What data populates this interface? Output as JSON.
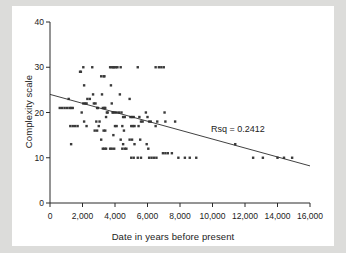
{
  "chart_data": {
    "type": "scatter",
    "title": "",
    "xlabel": "Date in years before present",
    "ylabel": "Complexity scale",
    "xlim": [
      0,
      16000
    ],
    "ylim": [
      0,
      40
    ],
    "grid": false,
    "legend": "none",
    "xticks": [
      0,
      2000,
      4000,
      6000,
      8000,
      10000,
      12000,
      14000,
      16000
    ],
    "xticklabels": [
      "0",
      "2,000",
      "4,000",
      "6,000",
      "8,000",
      "10,000",
      "12,000",
      "14,000",
      "16,000"
    ],
    "yticks": [
      0,
      10,
      20,
      30,
      40
    ],
    "yticklabels": [
      "0",
      "10",
      "20",
      "30",
      "40"
    ],
    "annotations": [
      {
        "text": "Rsq = 0.2412",
        "x": 12000,
        "y": 16.2
      }
    ],
    "trendline": {
      "type": "linear-fit",
      "x": [
        0,
        16000
      ],
      "y": [
        24.0,
        8.2
      ],
      "intercept": 24.0,
      "slope_per_1000yr": -0.9875,
      "r_squared": 0.2412
    },
    "marker": {
      "shape": "square",
      "color": "#3a3a3a",
      "size_px": 2.4
    },
    "series": [
      {
        "name": "Sites",
        "points": [
          [
            600,
            21
          ],
          [
            750,
            21
          ],
          [
            900,
            21
          ],
          [
            1050,
            21
          ],
          [
            1150,
            23
          ],
          [
            1200,
            21
          ],
          [
            1300,
            21
          ],
          [
            1400,
            21
          ],
          [
            1250,
            17
          ],
          [
            1400,
            17
          ],
          [
            1550,
            17
          ],
          [
            1700,
            17
          ],
          [
            1300,
            13
          ],
          [
            1850,
            29
          ],
          [
            1900,
            29
          ],
          [
            2050,
            30
          ],
          [
            1950,
            20
          ],
          [
            2050,
            22
          ],
          [
            2150,
            22
          ],
          [
            2250,
            22
          ],
          [
            2100,
            26
          ],
          [
            2300,
            23
          ],
          [
            2450,
            23
          ],
          [
            2250,
            17
          ],
          [
            2100,
            18
          ],
          [
            2600,
            30
          ],
          [
            2650,
            24
          ],
          [
            2700,
            22
          ],
          [
            2800,
            22
          ],
          [
            2900,
            21
          ],
          [
            2950,
            21
          ],
          [
            2850,
            18
          ],
          [
            2750,
            16
          ],
          [
            2900,
            16
          ],
          [
            3050,
            18
          ],
          [
            3000,
            17
          ],
          [
            3150,
            28
          ],
          [
            3300,
            28
          ],
          [
            3350,
            28
          ],
          [
            3200,
            24
          ],
          [
            3250,
            21
          ],
          [
            3350,
            21
          ],
          [
            3400,
            21
          ],
          [
            3500,
            20
          ],
          [
            3550,
            20
          ],
          [
            3450,
            19
          ],
          [
            3300,
            16
          ],
          [
            3400,
            16
          ],
          [
            3150,
            14
          ],
          [
            3250,
            12
          ],
          [
            3350,
            12
          ],
          [
            3450,
            12
          ],
          [
            3700,
            30
          ],
          [
            3800,
            30
          ],
          [
            3900,
            30
          ],
          [
            3950,
            30
          ],
          [
            4050,
            30
          ],
          [
            4150,
            30
          ],
          [
            3750,
            26
          ],
          [
            3800,
            22
          ],
          [
            3850,
            20
          ],
          [
            3900,
            20
          ],
          [
            4000,
            20
          ],
          [
            4100,
            20
          ],
          [
            4000,
            17
          ],
          [
            4100,
            17
          ],
          [
            3900,
            15
          ],
          [
            3700,
            12
          ],
          [
            3800,
            12
          ],
          [
            3950,
            12
          ],
          [
            4350,
            30
          ],
          [
            4300,
            24
          ],
          [
            4250,
            20
          ],
          [
            4400,
            20
          ],
          [
            4500,
            19
          ],
          [
            4600,
            19
          ],
          [
            4450,
            17
          ],
          [
            4550,
            16
          ],
          [
            4350,
            14
          ],
          [
            4500,
            13
          ],
          [
            4600,
            12
          ],
          [
            4700,
            12
          ],
          [
            4450,
            12
          ],
          [
            4900,
            23
          ],
          [
            4950,
            19
          ],
          [
            5050,
            19
          ],
          [
            5150,
            19
          ],
          [
            5000,
            17
          ],
          [
            5100,
            17
          ],
          [
            5200,
            17
          ],
          [
            4900,
            14
          ],
          [
            5050,
            14
          ],
          [
            5200,
            13
          ],
          [
            5000,
            10
          ],
          [
            5150,
            10
          ],
          [
            5400,
            30
          ],
          [
            5500,
            19
          ],
          [
            5600,
            18
          ],
          [
            5700,
            18
          ],
          [
            5450,
            17
          ],
          [
            5550,
            14
          ],
          [
            5400,
            10
          ],
          [
            5600,
            10
          ],
          [
            5900,
            20
          ],
          [
            6000,
            19
          ],
          [
            6100,
            18
          ],
          [
            6200,
            18
          ],
          [
            5950,
            13
          ],
          [
            6050,
            12
          ],
          [
            6100,
            10
          ],
          [
            6250,
            10
          ],
          [
            6500,
            30
          ],
          [
            6700,
            30
          ],
          [
            6850,
            30
          ],
          [
            6600,
            18
          ],
          [
            6500,
            17
          ],
          [
            6400,
            10
          ],
          [
            6550,
            10
          ],
          [
            7000,
            30
          ],
          [
            7050,
            20
          ],
          [
            7100,
            18
          ],
          [
            6950,
            11
          ],
          [
            7100,
            11
          ],
          [
            7250,
            11
          ],
          [
            7500,
            11
          ],
          [
            7700,
            18
          ],
          [
            7900,
            10
          ],
          [
            8300,
            10
          ],
          [
            8600,
            10
          ],
          [
            9000,
            10
          ],
          [
            11400,
            13
          ],
          [
            12500,
            10
          ],
          [
            13100,
            10
          ],
          [
            14000,
            10
          ],
          [
            14400,
            10
          ],
          [
            14900,
            10
          ]
        ]
      }
    ]
  },
  "axes": {
    "x_tick_format": "comma-thousands",
    "y_tick_format": "integer"
  }
}
